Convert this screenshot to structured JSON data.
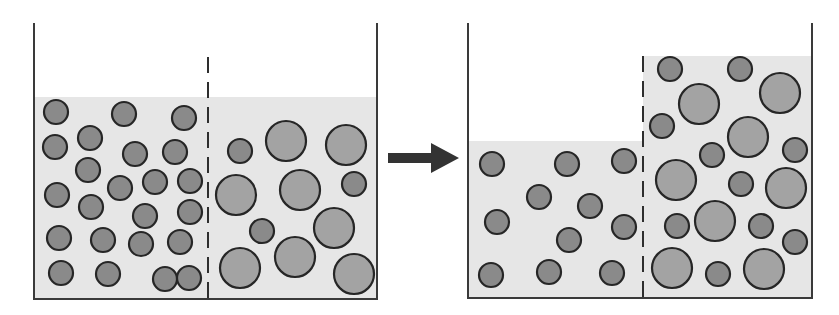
{
  "colors": {
    "background": "#ffffff",
    "fluid": "#e6e6e6",
    "wall": "#3a3a3a",
    "membrane": "#2e2e2e",
    "small_particle": "#8a8a8a",
    "large_particle": "#a3a3a3",
    "particle_stroke": "#262626",
    "arrow": "#333333"
  },
  "panels": [
    {
      "name": "before",
      "container": {
        "left": 34,
        "right": 377,
        "top": 23,
        "bottom": 299
      },
      "membrane": {
        "x": 208,
        "top": 57
      },
      "left_fluid_top": 97,
      "right_fluid_top": 97,
      "small_particles": [
        [
          56,
          112
        ],
        [
          124,
          114
        ],
        [
          184,
          118
        ],
        [
          55,
          147
        ],
        [
          90,
          138
        ],
        [
          135,
          154
        ],
        [
          175,
          152
        ],
        [
          88,
          170
        ],
        [
          57,
          195
        ],
        [
          120,
          188
        ],
        [
          155,
          182
        ],
        [
          190,
          181
        ],
        [
          91,
          207
        ],
        [
          145,
          216
        ],
        [
          190,
          212
        ],
        [
          59,
          238
        ],
        [
          103,
          240
        ],
        [
          141,
          244
        ],
        [
          180,
          242
        ],
        [
          61,
          273
        ],
        [
          108,
          274
        ],
        [
          165,
          279
        ],
        [
          189,
          278
        ],
        [
          240,
          151
        ],
        [
          354,
          184
        ],
        [
          262,
          231
        ]
      ],
      "large_particles": [
        [
          286,
          141
        ],
        [
          346,
          145
        ],
        [
          236,
          195
        ],
        [
          300,
          190
        ],
        [
          334,
          228
        ],
        [
          240,
          268
        ],
        [
          295,
          257
        ],
        [
          354,
          274
        ]
      ]
    },
    {
      "name": "after",
      "container": {
        "left": 468,
        "right": 812,
        "top": 23,
        "bottom": 298
      },
      "membrane": {
        "x": 643,
        "top": 56
      },
      "left_fluid_top": 141,
      "right_fluid_top": 56,
      "small_particles": [
        [
          492,
          164
        ],
        [
          567,
          164
        ],
        [
          624,
          161
        ],
        [
          539,
          197
        ],
        [
          590,
          206
        ],
        [
          497,
          222
        ],
        [
          569,
          240
        ],
        [
          624,
          227
        ],
        [
          491,
          275
        ],
        [
          549,
          272
        ],
        [
          612,
          273
        ],
        [
          670,
          69
        ],
        [
          740,
          69
        ],
        [
          662,
          126
        ],
        [
          712,
          155
        ],
        [
          795,
          150
        ],
        [
          741,
          184
        ],
        [
          677,
          226
        ],
        [
          761,
          226
        ],
        [
          795,
          242
        ],
        [
          718,
          274
        ]
      ],
      "large_particles": [
        [
          699,
          104
        ],
        [
          780,
          93
        ],
        [
          748,
          137
        ],
        [
          676,
          180
        ],
        [
          786,
          188
        ],
        [
          715,
          221
        ],
        [
          672,
          268
        ],
        [
          764,
          269
        ]
      ]
    }
  ],
  "arrow": {
    "x1": 388,
    "x2": 459,
    "y": 158,
    "shaft_half": 5,
    "head_half": 15,
    "head_len": 28
  },
  "radii": {
    "small": 12,
    "large": 20
  }
}
